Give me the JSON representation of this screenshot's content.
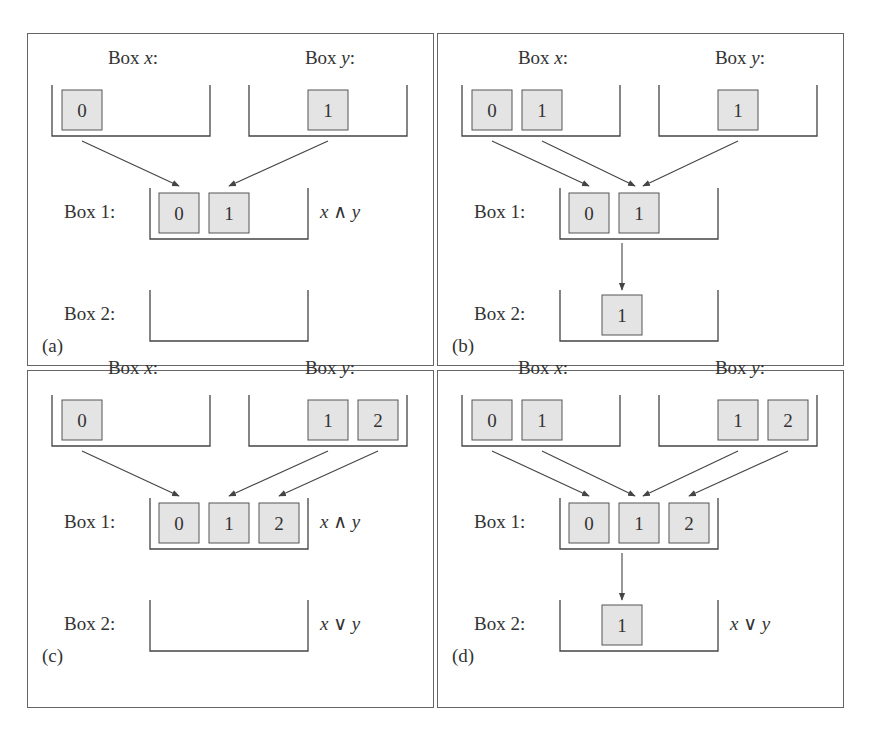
{
  "figure": {
    "panels": [
      {
        "id": "a",
        "tag": "(a)",
        "box_x": {
          "label_prefix": "Box ",
          "label_var": "x",
          "label_suffix": ":",
          "items": [
            "0"
          ]
        },
        "box_y": {
          "label_prefix": "Box ",
          "label_var": "y",
          "label_suffix": ":",
          "items": [
            "1"
          ]
        },
        "box1": {
          "label": "Box 1:",
          "items": [
            "0",
            "1"
          ],
          "annotation": "x ∧ y"
        },
        "box2": {
          "label": "Box 2:",
          "items": [],
          "annotation": ""
        }
      },
      {
        "id": "b",
        "tag": "(b)",
        "box_x": {
          "label_prefix": "Box ",
          "label_var": "x",
          "label_suffix": ":",
          "items": [
            "0",
            "1"
          ]
        },
        "box_y": {
          "label_prefix": "Box ",
          "label_var": "y",
          "label_suffix": ":",
          "items": [
            "1"
          ]
        },
        "box1": {
          "label": "Box 1:",
          "items": [
            "0",
            "1"
          ],
          "annotation": ""
        },
        "box2": {
          "label": "Box 2:",
          "items": [
            "1"
          ],
          "annotation": ""
        }
      },
      {
        "id": "c",
        "tag": "(c)",
        "box_x": {
          "label_prefix": "Box ",
          "label_var": "x",
          "label_suffix": ":",
          "items": [
            "0"
          ]
        },
        "box_y": {
          "label_prefix": "Box ",
          "label_var": "y",
          "label_suffix": ":",
          "items": [
            "1",
            "2"
          ]
        },
        "box1": {
          "label": "Box 1:",
          "items": [
            "0",
            "1",
            "2"
          ],
          "annotation": "x ∧ y"
        },
        "box2": {
          "label": "Box 2:",
          "items": [],
          "annotation": "x ∨ y"
        }
      },
      {
        "id": "d",
        "tag": "(d)",
        "box_x": {
          "label_prefix": "Box ",
          "label_var": "x",
          "label_suffix": ":",
          "items": [
            "0",
            "1"
          ]
        },
        "box_y": {
          "label_prefix": "Box ",
          "label_var": "y",
          "label_suffix": ":",
          "items": [
            "1",
            "2"
          ]
        },
        "box1": {
          "label": "Box 1:",
          "items": [
            "0",
            "1",
            "2"
          ],
          "annotation": ""
        },
        "box2": {
          "label": "Box 2:",
          "items": [
            "1"
          ],
          "annotation": "x ∨ y"
        }
      }
    ],
    "colors": {
      "line": "#444444",
      "item_fill": "#e4e4e4",
      "item_stroke": "#555555",
      "text": "#333333"
    }
  }
}
